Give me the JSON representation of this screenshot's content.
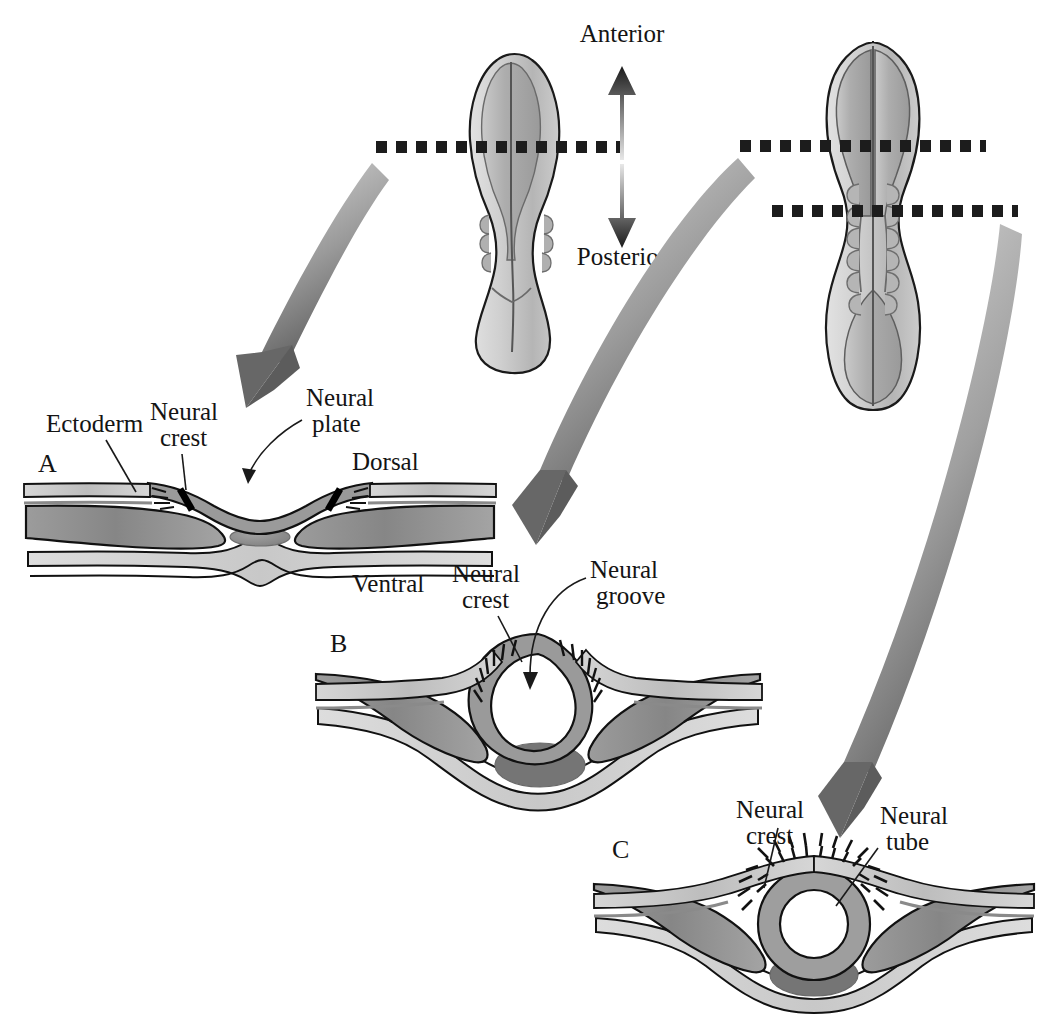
{
  "figure": {
    "background_color": "#ffffff"
  },
  "orientation": {
    "anterior_label": "Anterior",
    "posterior_label": "Posterior",
    "dorsal_label": "Dorsal",
    "ventral_label": "Ventral"
  },
  "embryos": [
    {
      "id": "embryo-left",
      "stage_note": "earlier stage, broad hourglass body",
      "section_lines": 1
    },
    {
      "id": "embryo-right",
      "stage_note": "later stage, elongated body with somites",
      "section_lines": 2
    }
  ],
  "panels": [
    {
      "letter": "A",
      "name": "neural-plate-stage",
      "labels": [
        {
          "key": "ectoderm",
          "text": "Ectoderm"
        },
        {
          "key": "neural_crest",
          "text": "Neural\ncrest",
          "line1": "Neural",
          "line2": "crest"
        },
        {
          "key": "neural_plate",
          "text": "Neural\nplate",
          "line1": "Neural",
          "line2": "plate"
        },
        {
          "key": "dorsal",
          "text": "Dorsal"
        },
        {
          "key": "ventral",
          "text": "Ventral"
        }
      ]
    },
    {
      "letter": "B",
      "name": "neural-groove-stage",
      "labels": [
        {
          "key": "neural_crest",
          "line1": "Neural",
          "line2": "crest"
        },
        {
          "key": "neural_groove",
          "line1": "Neural",
          "line2": "groove"
        }
      ]
    },
    {
      "letter": "C",
      "name": "neural-tube-stage",
      "labels": [
        {
          "key": "neural_crest",
          "line1": "Neural",
          "line2": "crest"
        },
        {
          "key": "neural_tube",
          "line1": "Neural",
          "line2": "tube"
        }
      ]
    }
  ],
  "text": {
    "anterior": "Anterior",
    "posterior": "Posterior",
    "dorsal": "Dorsal",
    "ventral": "Ventral",
    "neural": "Neural",
    "crest": "crest",
    "plate": "plate",
    "groove": "groove",
    "tube": "tube",
    "ectoderm": "Ectoderm",
    "panel_a": "A",
    "panel_b": "B",
    "panel_c": "C"
  },
  "colors": {
    "outline": "#111111",
    "ectoderm_fill": "#c9c9c9",
    "neural_fill": "#9a9a9a",
    "mesoderm_fill": "#8c8c8c",
    "endoderm_fill": "#d2d2d2",
    "notochord_fill": "#8a8a8a",
    "gut_fill": "#777777",
    "arrow_gray": "#6e6e6e",
    "dash_black": "#1c1c1c",
    "embryo_light": "#d8d8d8",
    "embryo_mid": "#b4b4b4",
    "embryo_dark": "#9c9c9c",
    "text": "#141414"
  }
}
